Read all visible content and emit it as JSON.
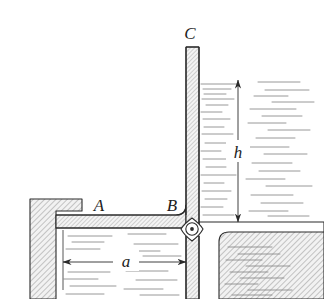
{
  "figure": {
    "kind": "engineering-diagram",
    "background_color": "#ffffff",
    "line_color": "#2b2b2b",
    "hatch_color": "#8c8c8c",
    "water_color": "#8f8f8f"
  },
  "labels": {
    "point_a": "A",
    "point_b": "B",
    "point_c": "C",
    "distance_a": "a",
    "height_h": "h"
  },
  "dimensions": {
    "horizontal": {
      "symbol": "a",
      "orientation": "horizontal",
      "arrow_style": "double-headed",
      "from_x": 63,
      "to_x": 186,
      "y": 262
    },
    "vertical": {
      "symbol": "h",
      "orientation": "vertical",
      "arrow_style": "double-headed",
      "x": 238,
      "from_y": 80,
      "to_y": 222
    }
  },
  "components": {
    "left_wall": "stepped-hatched-wall",
    "horizontal_pipe": "hatched-duct-A-to-B",
    "vertical_pipe": "hatched-standpipe-B-to-C",
    "right_floor": "hatched-floor",
    "junction_symbol": "pivot-valve-circle-with-dot",
    "water_upper_right": "water-hatch-squiggles",
    "water_lower_left": "water-hatch-squiggles",
    "water_lower_right": "water-hatch-squiggles"
  },
  "geometry": {
    "standpipe_top_y": 47,
    "standpipe_left_x": 186,
    "standpipe_right_x": 199,
    "horizontal_pipe_top_y": 215,
    "horizontal_pipe_bottom_y": 228,
    "junction_x": 192,
    "junction_y": 229,
    "water_surface_y": 80,
    "floor_y": 222
  }
}
